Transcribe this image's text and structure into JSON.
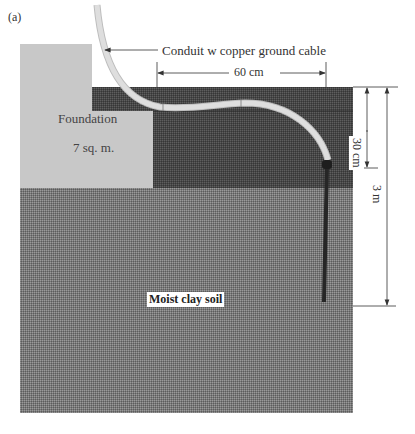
{
  "figure": {
    "panel_label": "(a)",
    "labels": {
      "conduit": "Conduit w copper ground cable",
      "foundation_line1": "Foundation",
      "foundation_line2": "7 sq. m.",
      "soil": "Moist clay soil"
    },
    "dimensions": {
      "horizontal": "60 cm",
      "vertical_short": "30 cm",
      "vertical_long": "3 m"
    },
    "colors": {
      "foundation": "#c8c8c8",
      "dark_layer": "#4a4a4a",
      "clay_soil": "#7a7a7a",
      "conduit": "#d6d6d6",
      "rod": "#262626"
    }
  }
}
